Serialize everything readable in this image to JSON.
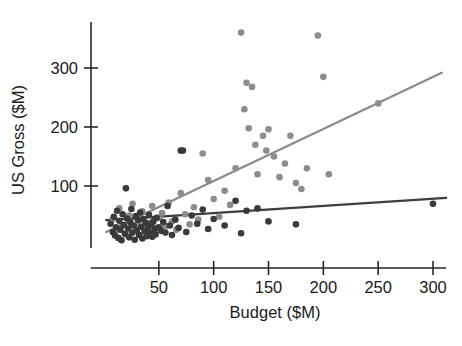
{
  "chart": {
    "type": "scatter",
    "title": "",
    "xlabel": "Budget ($M)",
    "ylabel": "US Gross ($M)"
  },
  "chart_data": {
    "type": "scatter",
    "title": "",
    "xlabel": "Budget ($M)",
    "ylabel": "US Gross ($M)",
    "xlim": [
      0,
      312
    ],
    "ylim": [
      0,
      372
    ],
    "grid": false,
    "legend": "none",
    "xticks": [
      50,
      100,
      150,
      200,
      250,
      300
    ],
    "xtick_labels": [
      "50",
      "100",
      "150",
      "200",
      "250",
      "300"
    ],
    "yticks": [
      100,
      200,
      300
    ],
    "ytick_labels": [
      "100",
      "200",
      "300"
    ],
    "colors": {
      "series_dark": "#3a3a3a",
      "series_light": "#8c8c8c",
      "fit_dark": "#3d3d3d",
      "fit_light": "#8a8a8a",
      "axis": "#262626",
      "background": "#ffffff"
    },
    "series": [
      {
        "name": "dark-points",
        "color": "#3a3a3a",
        "marker": "circle",
        "points": [
          [
            6,
            36
          ],
          [
            8,
            22
          ],
          [
            9,
            48
          ],
          [
            10,
            16
          ],
          [
            11,
            30
          ],
          [
            12,
            58
          ],
          [
            13,
            12
          ],
          [
            14,
            41
          ],
          [
            15,
            26
          ],
          [
            16,
            8
          ],
          [
            17,
            52
          ],
          [
            18,
            34
          ],
          [
            19,
            19
          ],
          [
            20,
            96
          ],
          [
            21,
            45
          ],
          [
            22,
            28
          ],
          [
            23,
            13
          ],
          [
            24,
            38
          ],
          [
            25,
            61
          ],
          [
            26,
            21
          ],
          [
            27,
            33
          ],
          [
            28,
            9
          ],
          [
            29,
            49
          ],
          [
            30,
            25
          ],
          [
            31,
            42
          ],
          [
            32,
            17
          ],
          [
            33,
            55
          ],
          [
            34,
            31
          ],
          [
            35,
            11
          ],
          [
            36,
            44
          ],
          [
            37,
            23
          ],
          [
            38,
            37
          ],
          [
            39,
            15
          ],
          [
            40,
            29
          ],
          [
            41,
            51
          ],
          [
            42,
            20
          ],
          [
            43,
            35
          ],
          [
            44,
            14
          ],
          [
            45,
            40
          ],
          [
            46,
            27
          ],
          [
            47,
            18
          ],
          [
            48,
            46
          ],
          [
            50,
            30
          ],
          [
            52,
            24
          ],
          [
            54,
            39
          ],
          [
            56,
            21
          ],
          [
            58,
            66
          ],
          [
            60,
            33
          ],
          [
            62,
            17
          ],
          [
            65,
            43
          ],
          [
            68,
            29
          ],
          [
            70,
            160
          ],
          [
            72,
            160
          ],
          [
            75,
            22
          ],
          [
            80,
            50
          ],
          [
            85,
            36
          ],
          [
            90,
            60
          ],
          [
            95,
            27
          ],
          [
            100,
            44
          ],
          [
            110,
            33
          ],
          [
            120,
            75
          ],
          [
            125,
            20
          ],
          [
            130,
            58
          ],
          [
            140,
            62
          ],
          [
            150,
            40
          ],
          [
            175,
            35
          ],
          [
            300,
            70
          ]
        ]
      },
      {
        "name": "light-points",
        "color": "#8c8c8c",
        "marker": "circle",
        "points": [
          [
            8,
            44
          ],
          [
            11,
            25
          ],
          [
            14,
            62
          ],
          [
            17,
            34
          ],
          [
            20,
            18
          ],
          [
            23,
            50
          ],
          [
            26,
            70
          ],
          [
            29,
            31
          ],
          [
            32,
            41
          ],
          [
            35,
            57
          ],
          [
            38,
            23
          ],
          [
            41,
            37
          ],
          [
            44,
            66
          ],
          [
            47,
            29
          ],
          [
            50,
            46
          ],
          [
            53,
            54
          ],
          [
            56,
            32
          ],
          [
            59,
            72
          ],
          [
            62,
            40
          ],
          [
            66,
            26
          ],
          [
            70,
            88
          ],
          [
            74,
            52
          ],
          [
            78,
            35
          ],
          [
            82,
            64
          ],
          [
            86,
            43
          ],
          [
            90,
            155
          ],
          [
            95,
            110
          ],
          [
            100,
            78
          ],
          [
            105,
            48
          ],
          [
            110,
            92
          ],
          [
            115,
            68
          ],
          [
            120,
            130
          ],
          [
            125,
            360
          ],
          [
            128,
            230
          ],
          [
            130,
            275
          ],
          [
            132,
            198
          ],
          [
            135,
            268
          ],
          [
            138,
            170
          ],
          [
            140,
            120
          ],
          [
            145,
            185
          ],
          [
            148,
            160
          ],
          [
            150,
            196
          ],
          [
            155,
            150
          ],
          [
            160,
            115
          ],
          [
            165,
            138
          ],
          [
            170,
            185
          ],
          [
            175,
            105
          ],
          [
            180,
            95
          ],
          [
            185,
            130
          ],
          [
            195,
            355
          ],
          [
            200,
            285
          ],
          [
            205,
            120
          ],
          [
            250,
            240
          ]
        ]
      }
    ],
    "fit_lines": [
      {
        "name": "light-regression",
        "color": "#8a8a8a",
        "x0": 2,
        "y0": 22,
        "x1": 308,
        "y1": 292
      },
      {
        "name": "dark-regression",
        "color": "#3d3d3d",
        "x0": 2,
        "y0": 42,
        "x1": 312,
        "y1": 80
      }
    ]
  }
}
